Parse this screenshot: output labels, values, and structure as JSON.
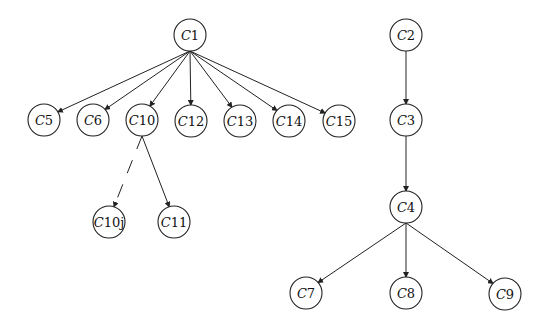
{
  "diagram": {
    "type": "directed-tree",
    "nodes": [
      {
        "id": "C1",
        "prefix": "C",
        "suffix": "1",
        "x": 190,
        "y": 35
      },
      {
        "id": "C5",
        "prefix": "C",
        "suffix": "5",
        "x": 44,
        "y": 120
      },
      {
        "id": "C6",
        "prefix": "C",
        "suffix": "6",
        "x": 93,
        "y": 120
      },
      {
        "id": "C10",
        "prefix": "C",
        "suffix": "10",
        "x": 142,
        "y": 120
      },
      {
        "id": "C12",
        "prefix": "C",
        "suffix": "12",
        "x": 191,
        "y": 121
      },
      {
        "id": "C13",
        "prefix": "C",
        "suffix": "13",
        "x": 240,
        "y": 121
      },
      {
        "id": "C14",
        "prefix": "C",
        "suffix": "14",
        "x": 289,
        "y": 121
      },
      {
        "id": "C15",
        "prefix": "C",
        "suffix": "15",
        "x": 339,
        "y": 121
      },
      {
        "id": "C10j",
        "prefix": "C",
        "suffix": "10j",
        "x": 109,
        "y": 222
      },
      {
        "id": "C11",
        "prefix": "C",
        "suffix": "11",
        "x": 174,
        "y": 222
      },
      {
        "id": "C2",
        "prefix": "C",
        "suffix": "2",
        "x": 406,
        "y": 35
      },
      {
        "id": "C3",
        "prefix": "C",
        "suffix": "3",
        "x": 406,
        "y": 120
      },
      {
        "id": "C4",
        "prefix": "C",
        "suffix": "4",
        "x": 406,
        "y": 207
      },
      {
        "id": "C7",
        "prefix": "C",
        "suffix": "7",
        "x": 306,
        "y": 293
      },
      {
        "id": "C8",
        "prefix": "C",
        "suffix": "8",
        "x": 406,
        "y": 293
      },
      {
        "id": "C9",
        "prefix": "C",
        "suffix": "9",
        "x": 505,
        "y": 294
      }
    ],
    "edges": [
      {
        "from": "C1",
        "to": "C5",
        "style": "solid",
        "arrow": true
      },
      {
        "from": "C1",
        "to": "C6",
        "style": "solid",
        "arrow": true
      },
      {
        "from": "C1",
        "to": "C10",
        "style": "solid",
        "arrow": true
      },
      {
        "from": "C1",
        "to": "C12",
        "style": "solid",
        "arrow": true
      },
      {
        "from": "C1",
        "to": "C13",
        "style": "solid",
        "arrow": true
      },
      {
        "from": "C1",
        "to": "C14",
        "style": "solid",
        "arrow": true
      },
      {
        "from": "C1",
        "to": "C15",
        "style": "solid",
        "arrow": true
      },
      {
        "from": "C10",
        "to": "C10j",
        "style": "dashed",
        "arrow": true
      },
      {
        "from": "C10",
        "to": "C11",
        "style": "solid",
        "arrow": true
      },
      {
        "from": "C2",
        "to": "C3",
        "style": "solid",
        "arrow": true
      },
      {
        "from": "C3",
        "to": "C4",
        "style": "solid",
        "arrow": true
      },
      {
        "from": "C4",
        "to": "C7",
        "style": "solid",
        "arrow": true
      },
      {
        "from": "C4",
        "to": "C8",
        "style": "solid",
        "arrow": true
      },
      {
        "from": "C4",
        "to": "C9",
        "style": "solid",
        "arrow": true
      }
    ],
    "node_radius": 16,
    "colors": {
      "background": "#ffffff",
      "stroke": "#222222",
      "text": "#111111"
    }
  }
}
